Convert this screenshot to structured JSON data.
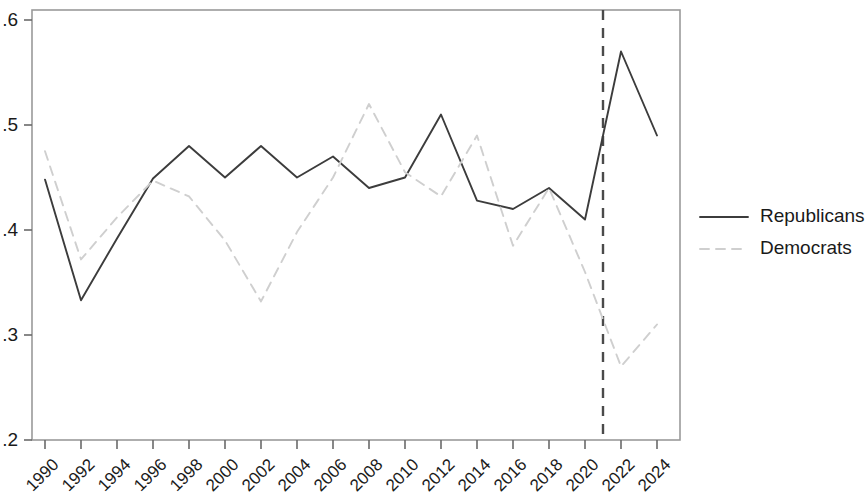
{
  "chart_data": {
    "type": "line",
    "title": "",
    "subtitle": "",
    "xlabel": "",
    "ylabel": "",
    "x": [
      1990,
      1992,
      1994,
      1996,
      1998,
      2000,
      2002,
      2004,
      2006,
      2008,
      2010,
      2012,
      2014,
      2016,
      2018,
      2020,
      2022,
      2024
    ],
    "xtick_labels": [
      "1990",
      "1992",
      "1994",
      "1996",
      "1998",
      "2000",
      "2002",
      "2004",
      "2006",
      "2008",
      "2010",
      "2012",
      "2014",
      "2016",
      "2018",
      "2020",
      "2022",
      "2024"
    ],
    "ytick_labels": [
      ".2",
      ".3",
      ".4",
      ".5",
      ".6"
    ],
    "yticks": [
      0.2,
      0.3,
      0.4,
      0.5,
      0.6
    ],
    "xlim": [
      1989,
      2025
    ],
    "ylim": [
      0.2,
      0.6
    ],
    "grid": false,
    "legend_position": "right",
    "series": [
      {
        "name": "Republicans",
        "style": "solid",
        "color": "#3c3c3c",
        "values": [
          0.448,
          0.333,
          0.392,
          0.449,
          0.48,
          0.45,
          0.48,
          0.45,
          0.47,
          0.44,
          0.45,
          0.51,
          0.428,
          0.42,
          0.44,
          0.41,
          0.57,
          0.49
        ]
      },
      {
        "name": "Democrats",
        "style": "dashed",
        "color": "#cfcfcf",
        "values": [
          0.475,
          0.372,
          0.412,
          0.447,
          0.432,
          0.39,
          0.332,
          0.398,
          0.45,
          0.52,
          0.455,
          0.432,
          0.49,
          0.385,
          0.44,
          0.36,
          0.27,
          0.31
        ]
      }
    ],
    "annotations": [
      {
        "name": "vertical-reference-line",
        "type": "vline",
        "x": 2021,
        "style": "dashed",
        "color": "#4a4a4a"
      }
    ]
  },
  "legend": {
    "items": [
      {
        "label": "Republicans",
        "style": "solid",
        "color": "#3c3c3c"
      },
      {
        "label": "Democrats",
        "style": "dashed",
        "color": "#cfcfcf"
      }
    ]
  },
  "axes": {
    "frame_color": "#9a9a9a",
    "tick_color": "#6a6a6a"
  }
}
